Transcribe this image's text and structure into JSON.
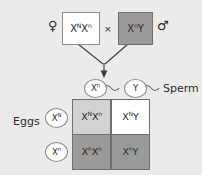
{
  "diagram": {
    "colors": {
      "background": "#ebebeb",
      "affected_fill": "#9a9a9a",
      "carrier_fill": "#d2d2d2",
      "normal_fill": "#ffffff",
      "line": "#6f6f6f",
      "text": "#2b2b2b"
    }
  },
  "parents": {
    "female": {
      "sex_symbol": "♀",
      "sex_symbol_name": "venus-female-symbol",
      "allele1": "X",
      "allele1_sup": "N",
      "allele2": "X",
      "allele2_sup": "n",
      "fill": "white"
    },
    "cross_symbol": "×",
    "male": {
      "sex_symbol": "♂",
      "sex_symbol_name": "mars-male-symbol",
      "allele1": "X",
      "allele1_sup": "n",
      "allele2": "Y",
      "allele2_sup": "",
      "fill": "gray"
    }
  },
  "gametes": {
    "sperm": {
      "label": "Sperm",
      "items": [
        {
          "allele": "X",
          "sup": "n"
        },
        {
          "allele": "Y",
          "sup": ""
        }
      ]
    },
    "eggs": {
      "label": "Eggs",
      "items": [
        {
          "allele": "X",
          "sup": "N"
        },
        {
          "allele": "X",
          "sup": "n"
        }
      ]
    }
  },
  "punnett": {
    "cells": [
      {
        "a1": "X",
        "s1": "N",
        "a2": "X",
        "s2": "n",
        "fill": "fill-lightgray",
        "name": "punnett-cell-carrier-female"
      },
      {
        "a1": "X",
        "s1": "N",
        "a2": "Y",
        "s2": "",
        "fill": "fill-white",
        "name": "punnett-cell-normal-male"
      },
      {
        "a1": "X",
        "s1": "n",
        "a2": "X",
        "s2": "n",
        "fill": "fill-gray",
        "name": "punnett-cell-affected-female"
      },
      {
        "a1": "X",
        "s1": "n",
        "a2": "Y",
        "s2": "",
        "fill": "fill-gray",
        "name": "punnett-cell-affected-male"
      }
    ]
  }
}
